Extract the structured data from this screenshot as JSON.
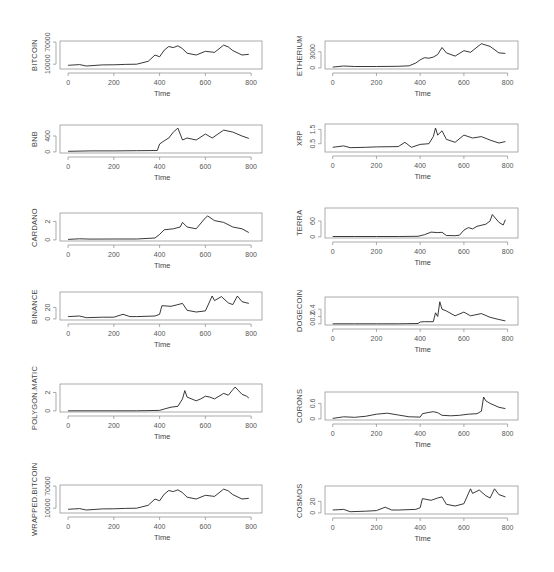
{
  "figure": {
    "xlabel": "Time",
    "x_ticks": [
      0,
      200,
      400,
      600,
      800
    ],
    "xlim": [
      0,
      800
    ]
  },
  "chart_data": [
    {
      "type": "line",
      "title": "",
      "xlabel": "Time",
      "ylabel": "BITCOIN",
      "y_ticks": [
        10000,
        70000
      ],
      "ylim": [
        0,
        70000
      ],
      "x_ticks": [
        0,
        200,
        400,
        600,
        800
      ],
      "x": [
        0,
        50,
        80,
        150,
        200,
        250,
        300,
        350,
        380,
        400,
        420,
        440,
        460,
        480,
        500,
        520,
        560,
        600,
        640,
        680,
        700,
        720,
        760,
        790
      ],
      "values": [
        7000,
        9000,
        5000,
        8000,
        8500,
        9500,
        10000,
        18000,
        35000,
        30000,
        48000,
        58000,
        55000,
        60000,
        52000,
        40000,
        35000,
        45000,
        42000,
        62000,
        57000,
        47000,
        35000,
        37000
      ]
    },
    {
      "type": "line",
      "title": "",
      "xlabel": "Time",
      "ylabel": "ETHERIUM",
      "y_ticks": [
        0,
        3000
      ],
      "ylim": [
        0,
        4800
      ],
      "x_ticks": [
        0,
        200,
        400,
        600,
        800
      ],
      "x": [
        0,
        50,
        100,
        200,
        300,
        350,
        380,
        400,
        420,
        440,
        460,
        480,
        500,
        520,
        560,
        600,
        630,
        680,
        720,
        760,
        790
      ],
      "values": [
        150,
        350,
        250,
        250,
        300,
        380,
        900,
        1500,
        1900,
        1800,
        2000,
        2500,
        3800,
        2800,
        2200,
        3200,
        2900,
        4500,
        4000,
        2800,
        2700
      ]
    },
    {
      "type": "line",
      "title": "",
      "xlabel": "Time",
      "ylabel": "BNB",
      "y_ticks": [
        0,
        400
      ],
      "ylim": [
        0,
        650
      ],
      "x_ticks": [
        0,
        200,
        400,
        600,
        800
      ],
      "x": [
        0,
        100,
        200,
        300,
        390,
        400,
        420,
        440,
        460,
        480,
        500,
        520,
        560,
        600,
        630,
        680,
        720,
        760,
        790
      ],
      "values": [
        15,
        25,
        25,
        30,
        35,
        200,
        280,
        350,
        500,
        600,
        300,
        350,
        300,
        450,
        350,
        550,
        500,
        400,
        340
      ]
    },
    {
      "type": "line",
      "title": "",
      "xlabel": "Time",
      "ylabel": "XRP",
      "y_ticks": [
        0.5,
        1.5
      ],
      "ylim": [
        0,
        1.8
      ],
      "x_ticks": [
        0,
        200,
        400,
        600,
        800
      ],
      "x": [
        0,
        50,
        80,
        150,
        200,
        300,
        330,
        360,
        400,
        440,
        460,
        470,
        480,
        500,
        520,
        560,
        600,
        640,
        680,
        720,
        760,
        790
      ],
      "values": [
        0.25,
        0.35,
        0.22,
        0.25,
        0.28,
        0.3,
        0.6,
        0.25,
        0.45,
        0.5,
        1.0,
        1.6,
        1.1,
        1.4,
        0.8,
        0.6,
        1.1,
        0.9,
        1.0,
        0.75,
        0.55,
        0.65
      ]
    },
    {
      "type": "line",
      "title": "",
      "xlabel": "Time",
      "ylabel": "CARDANO",
      "y_ticks": [
        0.0,
        2.0
      ],
      "ylim": [
        0,
        2.8
      ],
      "x_ticks": [
        0,
        200,
        400,
        600,
        800
      ],
      "x": [
        0,
        50,
        100,
        200,
        300,
        380,
        400,
        420,
        460,
        490,
        500,
        520,
        560,
        600,
        610,
        640,
        680,
        720,
        760,
        790
      ],
      "values": [
        0.05,
        0.12,
        0.08,
        0.1,
        0.1,
        0.2,
        0.6,
        1.1,
        1.2,
        1.4,
        1.9,
        1.4,
        1.2,
        2.4,
        2.6,
        2.1,
        1.9,
        1.4,
        1.2,
        0.8
      ]
    },
    {
      "type": "line",
      "title": "",
      "xlabel": "Time",
      "ylabel": "TERRA",
      "y_ticks": [
        0,
        60
      ],
      "ylim": [
        0,
        105
      ],
      "x_ticks": [
        0,
        200,
        400,
        600,
        800
      ],
      "x": [
        0,
        100,
        200,
        300,
        390,
        420,
        450,
        480,
        500,
        520,
        560,
        580,
        600,
        620,
        640,
        660,
        700,
        720,
        730,
        760,
        780,
        790
      ],
      "values": [
        1,
        1,
        1,
        1,
        2,
        8,
        18,
        16,
        17,
        5,
        4,
        6,
        25,
        35,
        30,
        40,
        48,
        60,
        85,
        55,
        45,
        65
      ]
    },
    {
      "type": "line",
      "title": "",
      "xlabel": "Time",
      "ylabel": "BINANCE",
      "y_ticks": [
        0,
        20
      ],
      "ylim": [
        0,
        45
      ],
      "x_ticks": [
        0,
        200,
        400,
        600,
        800
      ],
      "x": [
        0,
        50,
        80,
        150,
        200,
        240,
        270,
        300,
        380,
        400,
        410,
        450,
        480,
        500,
        520,
        560,
        600,
        630,
        640,
        670,
        700,
        720,
        740,
        760,
        790
      ],
      "values": [
        4,
        5,
        2,
        3,
        3,
        8,
        4,
        4,
        5,
        8,
        23,
        22,
        25,
        27,
        15,
        12,
        14,
        40,
        32,
        39,
        28,
        25,
        40,
        30,
        27
      ]
    },
    {
      "type": "line",
      "title": "",
      "xlabel": "Time",
      "ylabel": "DOGECOIN",
      "y_ticks": [
        0.0,
        0.2,
        0.4
      ],
      "ylim": [
        0,
        0.7
      ],
      "x_ticks": [
        0,
        200,
        400,
        600,
        800
      ],
      "x": [
        0,
        100,
        200,
        300,
        390,
        400,
        420,
        460,
        470,
        480,
        490,
        500,
        520,
        560,
        600,
        630,
        680,
        720,
        760,
        790
      ],
      "values": [
        0.003,
        0.003,
        0.003,
        0.003,
        0.01,
        0.05,
        0.06,
        0.06,
        0.3,
        0.2,
        0.6,
        0.4,
        0.35,
        0.22,
        0.32,
        0.22,
        0.28,
        0.18,
        0.12,
        0.08
      ]
    },
    {
      "type": "line",
      "title": "",
      "xlabel": "Time",
      "ylabel": "POLYGON.MATIC",
      "y_ticks": [
        0.0,
        2.0
      ],
      "ylim": [
        0,
        2.8
      ],
      "x_ticks": [
        0,
        200,
        400,
        600,
        800
      ],
      "x": [
        0,
        100,
        200,
        300,
        400,
        420,
        450,
        480,
        500,
        510,
        520,
        560,
        580,
        600,
        620,
        640,
        680,
        700,
        720,
        730,
        760,
        780,
        790
      ],
      "values": [
        0.01,
        0.01,
        0.01,
        0.01,
        0.05,
        0.2,
        0.4,
        0.5,
        1.3,
        2.2,
        1.5,
        1.1,
        1.3,
        1.6,
        1.5,
        1.3,
        1.9,
        1.7,
        2.3,
        2.6,
        1.8,
        1.6,
        1.4
      ]
    },
    {
      "type": "line",
      "title": "",
      "xlabel": "Time",
      "ylabel": "CORONS",
      "y_ticks": [
        0.0,
        0.6
      ],
      "ylim": [
        0,
        1.0
      ],
      "x_ticks": [
        0,
        200,
        400,
        600,
        800
      ],
      "x": [
        0,
        50,
        100,
        150,
        200,
        250,
        300,
        350,
        400,
        410,
        440,
        460,
        480,
        500,
        540,
        580,
        620,
        660,
        680,
        690,
        700,
        720,
        760,
        790
      ],
      "values": [
        0.02,
        0.08,
        0.06,
        0.1,
        0.18,
        0.22,
        0.15,
        0.08,
        0.07,
        0.2,
        0.25,
        0.28,
        0.24,
        0.14,
        0.12,
        0.14,
        0.18,
        0.2,
        0.3,
        0.85,
        0.7,
        0.6,
        0.45,
        0.4
      ]
    },
    {
      "type": "line",
      "title": "",
      "xlabel": "Time",
      "ylabel": "WRAPPED.BITCOIN",
      "y_ticks": [
        10000,
        70000
      ],
      "ylim": [
        0,
        70000
      ],
      "x_ticks": [
        0,
        200,
        400,
        600,
        800
      ],
      "x": [
        0,
        50,
        80,
        150,
        200,
        250,
        300,
        350,
        380,
        400,
        420,
        440,
        460,
        480,
        500,
        520,
        560,
        600,
        640,
        680,
        700,
        720,
        760,
        790
      ],
      "values": [
        7000,
        9000,
        5000,
        8000,
        8500,
        9500,
        10000,
        18000,
        35000,
        30000,
        48000,
        58000,
        55000,
        60000,
        52000,
        40000,
        35000,
        45000,
        42000,
        62000,
        57000,
        47000,
        35000,
        37000
      ]
    },
    {
      "type": "line",
      "title": "",
      "xlabel": "Time",
      "ylabel": "COSMOS",
      "y_ticks": [
        0,
        20
      ],
      "ylim": [
        0,
        45
      ],
      "x_ticks": [
        0,
        200,
        400,
        600,
        800
      ],
      "x": [
        0,
        50,
        80,
        150,
        200,
        240,
        270,
        300,
        380,
        400,
        410,
        450,
        480,
        500,
        520,
        560,
        600,
        630,
        640,
        670,
        700,
        720,
        740,
        760,
        790
      ],
      "values": [
        5,
        6,
        2,
        3,
        4,
        10,
        5,
        5,
        6,
        9,
        25,
        22,
        26,
        28,
        15,
        12,
        16,
        42,
        34,
        40,
        30,
        26,
        42,
        32,
        28
      ]
    }
  ]
}
